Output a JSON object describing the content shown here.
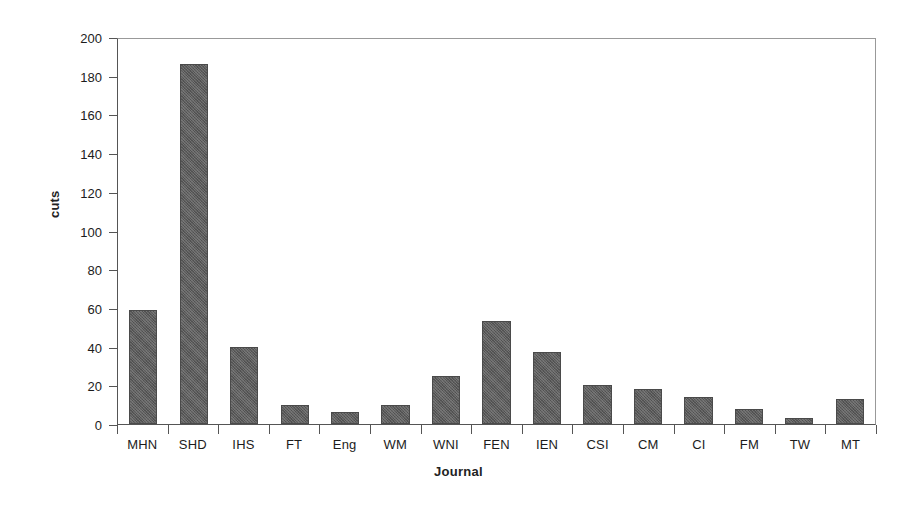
{
  "chart_data": {
    "type": "bar",
    "title": "",
    "xlabel": "Journal",
    "ylabel": "cuts",
    "categories": [
      "MHN",
      "SHD",
      "IHS",
      "FT",
      "Eng",
      "WM",
      "WNI",
      "FEN",
      "IEN",
      "CSI",
      "CM",
      "CI",
      "FM",
      "TW",
      "MT"
    ],
    "values": [
      59,
      186,
      40,
      10,
      6,
      10,
      25,
      53,
      37,
      20,
      18,
      14,
      8,
      3,
      13
    ],
    "ylim": [
      0,
      200
    ],
    "yticks": [
      0,
      20,
      40,
      60,
      80,
      100,
      120,
      140,
      160,
      180,
      200
    ],
    "ytick_labels": [
      "0",
      "20",
      "40",
      "60",
      "80",
      "100",
      "120",
      "140",
      "160",
      "180",
      "200"
    ],
    "grid": false,
    "legend": false,
    "bar_color": "#5c5c5c",
    "axis_color": "#555555",
    "background": "#ffffff"
  }
}
